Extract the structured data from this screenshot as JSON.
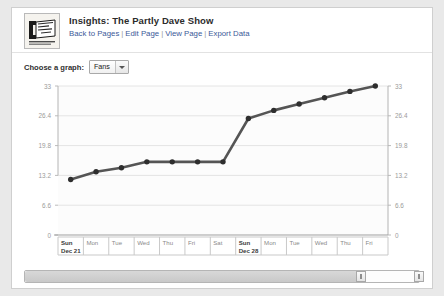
{
  "header": {
    "logo_alt": "partly-dave-show-logo",
    "title": "Insights: The Partly Dave Show",
    "links": [
      {
        "label": "Back to Pages"
      },
      {
        "label": "Edit Page"
      },
      {
        "label": "View Page"
      },
      {
        "label": "Export Data"
      }
    ],
    "separator": "|"
  },
  "chooser": {
    "label": "Choose a graph:",
    "selected": "Fans",
    "options": [
      "Fans"
    ]
  },
  "chart_data": {
    "type": "line",
    "title": "",
    "xlabel": "",
    "ylabel": "",
    "ylim": [
      0,
      33
    ],
    "yticks": [
      "0",
      "6.6",
      "13.2",
      "19.8",
      "26.4",
      "33"
    ],
    "ytick_values": [
      0,
      6.6,
      13.2,
      19.8,
      26.4,
      33
    ],
    "grid": true,
    "legend": "none",
    "axis_left_labels": [
      "33",
      "26.4",
      "19.8",
      "13.2",
      "6.6",
      "0"
    ],
    "axis_right_labels": [
      "33",
      "26.4",
      "19.8",
      "13.2",
      "6.6",
      "0"
    ],
    "categories": [
      "Sun\nDec 21",
      "Mon",
      "Tue",
      "Wed",
      "Thu",
      "Fri",
      "Sat",
      "Sun\nDec 28",
      "Mon",
      "Tue",
      "Wed",
      "Thu",
      "Fri"
    ],
    "xtick_labels": [
      {
        "day": "Sun",
        "date": "Dec 21"
      },
      {
        "day": "Mon",
        "date": ""
      },
      {
        "day": "Tue",
        "date": ""
      },
      {
        "day": "Wed",
        "date": ""
      },
      {
        "day": "Thu",
        "date": ""
      },
      {
        "day": "Fri",
        "date": ""
      },
      {
        "day": "Sat",
        "date": ""
      },
      {
        "day": "Sun",
        "date": "Dec 28"
      },
      {
        "day": "Mon",
        "date": ""
      },
      {
        "day": "Tue",
        "date": ""
      },
      {
        "day": "Wed",
        "date": ""
      },
      {
        "day": "Thu",
        "date": ""
      },
      {
        "day": "Fri",
        "date": ""
      }
    ],
    "series": [
      {
        "name": "Fans",
        "color": "#555555",
        "values": [
          12.3,
          14.0,
          14.9,
          16.2,
          16.2,
          16.2,
          16.2,
          25.8,
          27.6,
          29.0,
          30.4,
          31.8,
          33.0
        ]
      }
    ]
  },
  "scrollbar": {
    "name": "date-range-scrollbar",
    "left_handle": "left-range-handle",
    "right_handle": "right-range-handle"
  }
}
